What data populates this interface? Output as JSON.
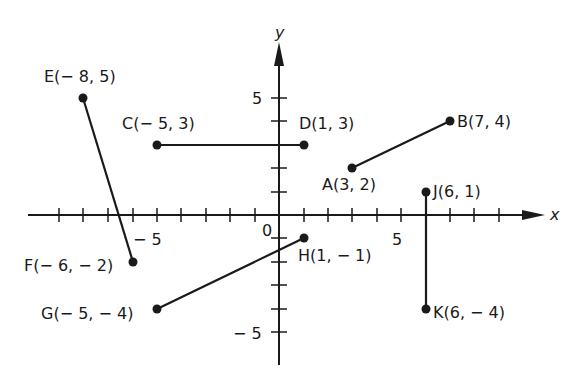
{
  "axes": {
    "x_label": "x",
    "y_label": "y",
    "origin_label": "0",
    "x_tick_labels": [
      {
        "value": -5,
        "text": "− 5"
      },
      {
        "value": 5,
        "text": "5"
      }
    ],
    "y_tick_labels": [
      {
        "value": 5,
        "text": "5"
      },
      {
        "value": -5,
        "text": "− 5"
      }
    ],
    "x_range": [
      -10,
      10
    ],
    "y_range": [
      -6,
      6
    ]
  },
  "points": [
    {
      "name": "A",
      "x": 3,
      "y": 2,
      "label": "A(3, 2)"
    },
    {
      "name": "B",
      "x": 7,
      "y": 4,
      "label": "B(7, 4)"
    },
    {
      "name": "C",
      "x": -5,
      "y": 3,
      "label": "C(− 5, 3)"
    },
    {
      "name": "D",
      "x": 1,
      "y": 3,
      "label": "D(1, 3)"
    },
    {
      "name": "E",
      "x": -8,
      "y": 5,
      "label": "E(− 8, 5)"
    },
    {
      "name": "F",
      "x": -6,
      "y": -2,
      "label": "F(− 6, − 2)"
    },
    {
      "name": "G",
      "x": -5,
      "y": -4,
      "label": "G(− 5, − 4)"
    },
    {
      "name": "H",
      "x": 1,
      "y": -1,
      "label": "H(1, − 1)"
    },
    {
      "name": "J",
      "x": 6,
      "y": 1,
      "label": "J(6, 1)"
    },
    {
      "name": "K",
      "x": 6,
      "y": -4,
      "label": "K(6, − 4)"
    }
  ],
  "segments": [
    {
      "from": "A",
      "to": "B"
    },
    {
      "from": "C",
      "to": "D"
    },
    {
      "from": "E",
      "to": "F"
    },
    {
      "from": "G",
      "to": "H"
    },
    {
      "from": "J",
      "to": "K"
    }
  ],
  "colors": {
    "ink": "#1a1a1a",
    "background": "#ffffff"
  }
}
